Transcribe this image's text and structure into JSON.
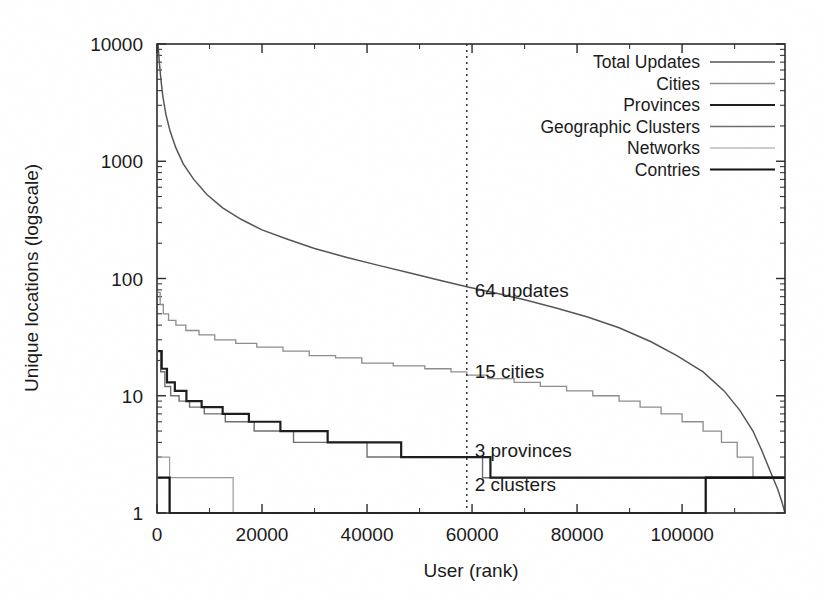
{
  "chart_data": {
    "type": "line",
    "title": "",
    "xlabel": "User (rank)",
    "ylabel": "Unique locations (logscale)",
    "yscale": "log",
    "xlim": [
      0,
      119600
    ],
    "ylim": [
      1,
      10000
    ],
    "grid": false,
    "legend_position": "top-right",
    "xticks": [
      0,
      20000,
      40000,
      60000,
      80000,
      100000
    ],
    "xtick_labels": [
      "0",
      "20000",
      "40000",
      "60000",
      "80000",
      "100000"
    ],
    "yticks": [
      1,
      10,
      100,
      1000,
      10000
    ],
    "ytick_labels": [
      "1",
      "10",
      "100",
      "1000",
      "10000"
    ],
    "legend": [
      {
        "label": "Total Updates",
        "color": "#555555",
        "width": 1.5
      },
      {
        "label": "Cities",
        "color": "#8d8d8d",
        "width": 1.3
      },
      {
        "label": "Provinces",
        "color": "#1d1d1d",
        "width": 2.2
      },
      {
        "label": "Geographic Clusters",
        "color": "#6f6f6f",
        "width": 1.4
      },
      {
        "label": "Networks",
        "color": "#9a9a9a",
        "width": 1.2
      },
      {
        "label": "Contries",
        "color": "#111111",
        "width": 2.2
      }
    ],
    "marker_line": {
      "x": 59000,
      "style": "dotted",
      "label": ""
    },
    "annotations": [
      {
        "text": "64 updates",
        "x": 60500,
        "y": 78
      },
      {
        "text": "15 cities",
        "x": 60500,
        "y": 15.8
      },
      {
        "text": "3 provinces",
        "x": 60500,
        "y": 3.35
      },
      {
        "text": "2 clusters",
        "x": 60500,
        "y": 1.72
      }
    ],
    "series": [
      {
        "name": "Total Updates",
        "color": "#555555",
        "width": 1.5,
        "step": false,
        "points": [
          [
            200,
            10000
          ],
          [
            400,
            7400
          ],
          [
            700,
            5200
          ],
          [
            1100,
            3600
          ],
          [
            1700,
            2500
          ],
          [
            2500,
            1800
          ],
          [
            3600,
            1300
          ],
          [
            5000,
            950
          ],
          [
            7000,
            700
          ],
          [
            9500,
            520
          ],
          [
            12500,
            400
          ],
          [
            16000,
            320
          ],
          [
            20000,
            260
          ],
          [
            25000,
            215
          ],
          [
            30000,
            180
          ],
          [
            36000,
            152
          ],
          [
            42000,
            130
          ],
          [
            48000,
            112
          ],
          [
            54000,
            96
          ],
          [
            59000,
            85
          ],
          [
            64000,
            76
          ],
          [
            70000,
            66
          ],
          [
            76000,
            56
          ],
          [
            82000,
            47
          ],
          [
            88000,
            38
          ],
          [
            94000,
            29
          ],
          [
            99000,
            22
          ],
          [
            104000,
            16
          ],
          [
            108000,
            11
          ],
          [
            111000,
            7.5
          ],
          [
            113500,
            5
          ],
          [
            115200,
            3.4
          ],
          [
            116400,
            2.5
          ],
          [
            117300,
            2.0
          ],
          [
            118200,
            1.6
          ],
          [
            119000,
            1.25
          ],
          [
            119600,
            1.0
          ]
        ]
      },
      {
        "name": "Cities",
        "color": "#8d8d8d",
        "width": 1.3,
        "step": true,
        "points": [
          [
            200,
            76
          ],
          [
            600,
            60
          ],
          [
            1200,
            50
          ],
          [
            2200,
            44
          ],
          [
            3600,
            40
          ],
          [
            5500,
            36
          ],
          [
            8000,
            33
          ],
          [
            11000,
            30
          ],
          [
            15000,
            28
          ],
          [
            19000,
            26
          ],
          [
            24000,
            24
          ],
          [
            29000,
            22
          ],
          [
            34000,
            21
          ],
          [
            39000,
            19
          ],
          [
            45000,
            18
          ],
          [
            51000,
            17
          ],
          [
            56000,
            16
          ],
          [
            59000,
            15
          ],
          [
            63000,
            14
          ],
          [
            68000,
            13
          ],
          [
            73000,
            12
          ],
          [
            78000,
            11
          ],
          [
            83000,
            10
          ],
          [
            88000,
            9
          ],
          [
            92000,
            8
          ],
          [
            96000,
            7
          ],
          [
            100000,
            6
          ],
          [
            104000,
            5
          ],
          [
            107500,
            4
          ],
          [
            110500,
            3
          ],
          [
            113500,
            2
          ],
          [
            119600,
            2
          ]
        ]
      },
      {
        "name": "Geographic Clusters",
        "color": "#6f6f6f",
        "width": 1.4,
        "step": true,
        "points": [
          [
            200,
            24
          ],
          [
            700,
            16
          ],
          [
            1500,
            12
          ],
          [
            2600,
            10
          ],
          [
            4200,
            9
          ],
          [
            6200,
            8
          ],
          [
            9000,
            7
          ],
          [
            13000,
            6
          ],
          [
            18500,
            5
          ],
          [
            26000,
            4
          ],
          [
            40000,
            3
          ],
          [
            62000,
            2
          ],
          [
            119600,
            2
          ]
        ]
      },
      {
        "name": "Provinces",
        "color": "#1d1d1d",
        "width": 2.2,
        "step": true,
        "points": [
          [
            200,
            24
          ],
          [
            900,
            17
          ],
          [
            1900,
            13
          ],
          [
            3400,
            11
          ],
          [
            5600,
            9
          ],
          [
            8500,
            8
          ],
          [
            12500,
            7
          ],
          [
            17500,
            6
          ],
          [
            23500,
            5
          ],
          [
            32500,
            4
          ],
          [
            46500,
            3
          ],
          [
            63500,
            2
          ],
          [
            119600,
            2
          ]
        ]
      },
      {
        "name": "Networks",
        "color": "#9a9a9a",
        "width": 1.2,
        "step": true,
        "points": [
          [
            200,
            3
          ],
          [
            2400,
            2
          ],
          [
            14500,
            1
          ],
          [
            119600,
            1
          ]
        ]
      },
      {
        "name": "Contries",
        "color": "#111111",
        "width": 2.2,
        "step": true,
        "points": [
          [
            200,
            2
          ],
          [
            2400,
            1
          ],
          [
            82500,
            1
          ],
          [
            104500,
            2
          ],
          [
            119600,
            2
          ]
        ]
      }
    ]
  },
  "figure": {
    "background": "#ffffff",
    "axis_color": "#2b2b2b"
  }
}
